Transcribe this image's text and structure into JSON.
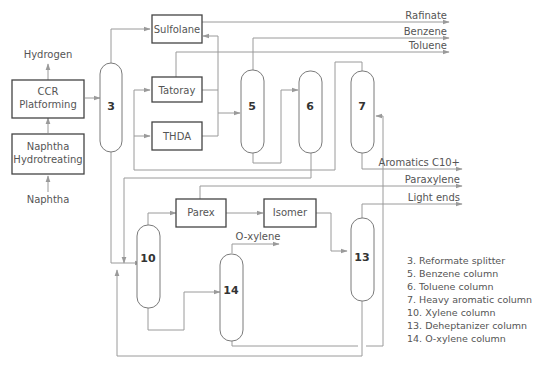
{
  "diagram": {
    "units": {
      "ccr": "CCR Platforming",
      "ccr_line1": "CCR",
      "ccr_line2": "Platforming",
      "nht_line1": "Naphtha",
      "nht_line2": "Hydrotreating",
      "sulfolane": "Sulfolane",
      "tatoray": "Tatoray",
      "thda": "THDA",
      "parex": "Parex",
      "isomer": "Isomer"
    },
    "columns": {
      "c3": "3",
      "c5": "5",
      "c6": "6",
      "c7": "7",
      "c10": "10",
      "c13": "13",
      "c14": "14"
    },
    "streams": {
      "hydrogen": "Hydrogen",
      "naphtha": "Naphtha",
      "rafinate": "Rafinate",
      "benzene": "Benzene",
      "toluene": "Toluene",
      "aromatics_c10": "Aromatics C10+",
      "paraxylene": "Paraxylene",
      "light_ends": "Light ends",
      "o_xylene": "O-xylene"
    },
    "legend": [
      "3. Reformate splitter",
      "5. Benzene column",
      "6. Toluene column",
      "7. Heavy aromatic column",
      "10. Xylene column",
      "13. Deheptanizer column",
      "14. O-xylene column"
    ]
  }
}
